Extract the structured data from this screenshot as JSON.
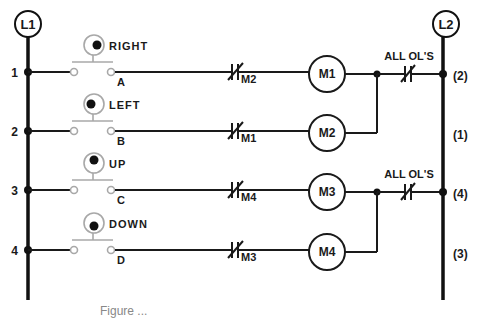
{
  "rails": {
    "left": {
      "label": "L1",
      "x": 28,
      "top": 24,
      "bottom": 300
    },
    "right": {
      "label": "L2",
      "x": 443,
      "top": 24,
      "bottom": 300
    }
  },
  "rungs": [
    {
      "number": "1",
      "y": 72,
      "button_label": "RIGHT",
      "button_terminal": "A",
      "button_dot": "right",
      "interlock_contact": "M2",
      "coil": "M1",
      "right_wire_number": "(2)"
    },
    {
      "number": "2",
      "y": 131,
      "button_label": "LEFT",
      "button_terminal": "B",
      "button_dot": "left",
      "interlock_contact": "M1",
      "coil": "M2",
      "right_wire_number": "(1)"
    },
    {
      "number": "3",
      "y": 190,
      "button_label": "UP",
      "button_terminal": "C",
      "button_dot": "up",
      "interlock_contact": "M4",
      "coil": "M3",
      "right_wire_number": "(4)"
    },
    {
      "number": "4",
      "y": 250,
      "button_label": "DOWN",
      "button_terminal": "D",
      "button_dot": "down",
      "interlock_contact": "M3",
      "coil": "M4",
      "right_wire_number": "(3)"
    }
  ],
  "overloads": [
    {
      "label": "ALL OL'S",
      "rung_top": 0,
      "rung_bottom": 1
    },
    {
      "label": "ALL OL'S",
      "rung_top": 2,
      "rung_bottom": 3
    }
  ],
  "caption": "Figure ..."
}
